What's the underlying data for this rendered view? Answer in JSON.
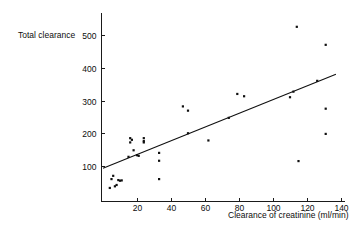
{
  "chart_data": {
    "type": "scatter",
    "title": "",
    "xlabel": "Clearance of creatinine (ml/min)",
    "ylabel": "Total clearance",
    "xlim": [
      0,
      143
    ],
    "ylim": [
      0,
      545
    ],
    "grid": false,
    "legend": null,
    "xticks": [
      20,
      40,
      60,
      80,
      100,
      120,
      140
    ],
    "yticks": [
      100,
      200,
      300,
      400,
      500
    ],
    "xtick_labels": [
      "20",
      "40",
      "60",
      "80",
      "100",
      "120",
      "140"
    ],
    "ytick_labels": [
      "100",
      "200",
      "300",
      "400",
      "500"
    ],
    "points": [
      {
        "x": 4,
        "y": 33
      },
      {
        "x": 5,
        "y": 60
      },
      {
        "x": 6,
        "y": 70
      },
      {
        "x": 7,
        "y": 38
      },
      {
        "x": 8,
        "y": 42
      },
      {
        "x": 9,
        "y": 57
      },
      {
        "x": 10,
        "y": 55
      },
      {
        "x": 11,
        "y": 56
      },
      {
        "x": 15,
        "y": 128
      },
      {
        "x": 16,
        "y": 185
      },
      {
        "x": 16,
        "y": 172
      },
      {
        "x": 17,
        "y": 180
      },
      {
        "x": 18,
        "y": 148
      },
      {
        "x": 20,
        "y": 133
      },
      {
        "x": 21,
        "y": 131
      },
      {
        "x": 24,
        "y": 185
      },
      {
        "x": 24,
        "y": 172
      },
      {
        "x": 24,
        "y": 176
      },
      {
        "x": 33,
        "y": 140
      },
      {
        "x": 33,
        "y": 116
      },
      {
        "x": 33,
        "y": 60
      },
      {
        "x": 47,
        "y": 282
      },
      {
        "x": 50,
        "y": 269
      },
      {
        "x": 50,
        "y": 200
      },
      {
        "x": 62,
        "y": 178
      },
      {
        "x": 74,
        "y": 247
      },
      {
        "x": 79,
        "y": 320
      },
      {
        "x": 83,
        "y": 313
      },
      {
        "x": 110,
        "y": 310
      },
      {
        "x": 112,
        "y": 327
      },
      {
        "x": 114,
        "y": 525
      },
      {
        "x": 115,
        "y": 115
      },
      {
        "x": 126,
        "y": 360
      },
      {
        "x": 131,
        "y": 470
      },
      {
        "x": 131,
        "y": 275
      },
      {
        "x": 131,
        "y": 198
      }
    ],
    "fit_line": {
      "x0": 0,
      "y0": 93,
      "x1": 137,
      "y1": 380
    }
  }
}
